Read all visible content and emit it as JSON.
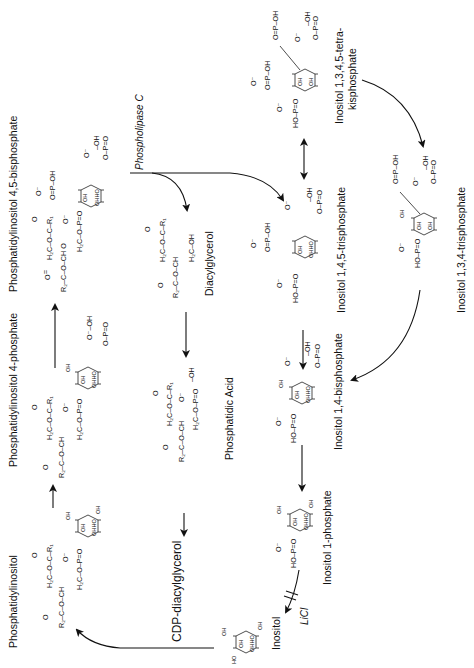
{
  "diagram": {
    "orientation": "rotated 90deg counter-clockwise (text reads bottom-to-top)",
    "nodes": {
      "pi": {
        "label": "Phosphatidylinositol"
      },
      "pi4p": {
        "label": "Phosphatidylinositol 4-phosphate"
      },
      "pip2": {
        "label": "Phosphatidylinositol 4,5-bisphosphate"
      },
      "dag": {
        "label": "Diacylglycerol"
      },
      "pa": {
        "label": "Phosphatidic Acid"
      },
      "cdp_dag": {
        "label": "CDP-diacylglycerol"
      },
      "ip3": {
        "label": "Inositol 1,4,5-trisphosphate"
      },
      "ip4": {
        "label_line1": "Inositol 1,3,4,5-tetra-",
        "label_line2": "kisphosphate"
      },
      "ip3_134": {
        "label": "Inositol 1,3,4-trisphosphate"
      },
      "ip2": {
        "label": "Inositol 1,4-bisphosphate"
      },
      "ip1": {
        "label": "Inositol 1-phosphate"
      },
      "inositol": {
        "label": "Inositol"
      }
    },
    "enzymes": {
      "plc": "Phospholipase C",
      "licl": "LiCl"
    },
    "chem": {
      "glycerol_row1": "O   H₂C–O–C–R₁",
      "acyl1": "O=C–R₁",
      "r2": "R₂–C–O–CH",
      "h2c_o": "H₂C–O–",
      "h2c_oh": "H₂C–OH",
      "phosphate": "O⁻–P–OH",
      "phosphate_eq": "O=P–OH",
      "ho_p": "HO–P=O",
      "oh": "OH",
      "ohho": "OHHO",
      "o_minus": "O⁻",
      "o": "O"
    }
  }
}
